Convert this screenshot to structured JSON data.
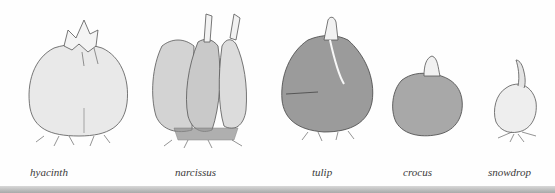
{
  "illustration": {
    "subject": "flower bulbs",
    "bulbs": [
      {
        "name": "hyacinth"
      },
      {
        "name": "narcissus"
      },
      {
        "name": "tulip"
      },
      {
        "name": "crocus"
      },
      {
        "name": "snowdrop"
      }
    ]
  },
  "colors": {
    "background": "#ffffff",
    "ink": "#3a3a3a",
    "hyacinth_fill": "#e9e9e9",
    "narcissus_fill": "#cfcfcf",
    "tulip_fill": "#9b9b9b",
    "crocus_fill": "#a8a8a8",
    "snowdrop_fill": "#eeeeee",
    "bottom_bar": "#b5b5b5"
  }
}
